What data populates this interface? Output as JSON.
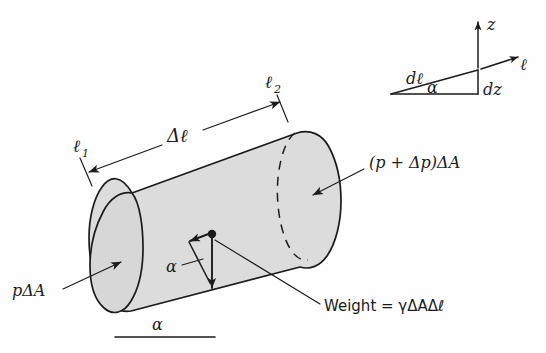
{
  "figure": {
    "background_color": "#fefefe",
    "ink_color": "#1b1b1b",
    "body_fill_color": "#dcdcdc"
  },
  "labels": {
    "ell_1": "ℓ",
    "ell_1_sub": "1",
    "ell_2": "ℓ",
    "ell_2_sub": "2",
    "delta_ell": "Δℓ",
    "pressure_left": "pΔA",
    "pressure_right": "(p + Δp)ΔA",
    "weight": "Weight = γΔAΔℓ",
    "alpha_vector": "α",
    "alpha_base": "α"
  },
  "inset": {
    "axis_z": "z",
    "axis_ell": "ℓ",
    "hypotenuse": "dℓ",
    "vertical": "dz",
    "angle": "α"
  }
}
